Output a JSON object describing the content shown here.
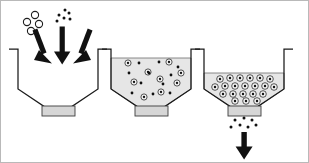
{
  "figure": {
    "title": "Three-stage particle encapsulation and discharge in a hopper vessel",
    "background_color": "#ffffff",
    "border_color": "#b9b9b9",
    "width": 309,
    "height": 163,
    "stage_count": 3
  },
  "palette": {
    "outline": "#1a1a1a",
    "bed_fill": "#e6e6e6",
    "bed_stroke": "#5a5a5a",
    "valve_fill": "#d6d6d6",
    "valve_stroke": "#3d3d3d",
    "particle_ring_fill": "#f2f2f2",
    "particle_ring_stroke": "#222222",
    "particle_core": "#111111",
    "dot_color": "#111111",
    "open_circle_stroke": "#1d1d1d",
    "arrow_color": "#111111"
  },
  "stages": [
    {
      "id": "stage-1",
      "name": "charging",
      "label": "",
      "vessel": {
        "left_wall_x": 17,
        "right_wall_x": 97,
        "rim_y": 48,
        "lip_width": 9,
        "taper_start_y": 88,
        "outlet_left_x": 44,
        "outlet_right_x": 70,
        "outlet_y": 106
      },
      "bed": {
        "present": false,
        "fill_level_y": null
      },
      "valve": {
        "present": true,
        "x": 41,
        "y": 105,
        "width": 33,
        "height": 10,
        "open": false
      },
      "feed_arrows": [
        {
          "id": "arrow-left",
          "x1": 33,
          "y1": 30,
          "x2": 45,
          "y2": 63,
          "angle_deg": 20
        },
        {
          "id": "arrow-center",
          "x1": 61,
          "y1": 26,
          "x2": 61,
          "y2": 63,
          "angle_deg": 0
        },
        {
          "id": "arrow-right",
          "x1": 90,
          "y1": 30,
          "x2": 78,
          "y2": 63,
          "angle_deg": -20
        }
      ],
      "open_circles": [
        {
          "cx": 34,
          "cy": 14,
          "r": 3.6
        },
        {
          "cx": 26,
          "cy": 21,
          "r": 3.6
        },
        {
          "cx": 38,
          "cy": 23,
          "r": 3.6
        },
        {
          "cx": 30,
          "cy": 30,
          "r": 3.6
        }
      ],
      "free_dots": [
        {
          "cx": 64,
          "cy": 9,
          "r": 1.5
        },
        {
          "cx": 68,
          "cy": 12,
          "r": 1.5
        },
        {
          "cx": 58,
          "cy": 14,
          "r": 1.5
        },
        {
          "cx": 63,
          "cy": 17,
          "r": 1.5
        },
        {
          "cx": 69,
          "cy": 18,
          "r": 1.5
        },
        {
          "cx": 56,
          "cy": 20,
          "r": 1.5
        }
      ],
      "encapsulated_particles": [],
      "discharge": {
        "present": false
      }
    },
    {
      "id": "stage-2",
      "name": "suspension",
      "label": "",
      "vessel": {
        "left_wall_x": 110,
        "right_wall_x": 190,
        "rim_y": 48,
        "lip_width": 9,
        "taper_start_y": 88,
        "outlet_left_x": 137,
        "outlet_right_x": 163,
        "outlet_y": 106
      },
      "bed": {
        "present": true,
        "fill_level_y": 57
      },
      "valve": {
        "present": true,
        "x": 134,
        "y": 105,
        "width": 33,
        "height": 10,
        "open": false
      },
      "feed_arrows": [],
      "open_circles": [],
      "free_dots": [
        {
          "cx": 138,
          "cy": 62,
          "r": 1.4
        },
        {
          "cx": 158,
          "cy": 61,
          "r": 1.4
        },
        {
          "cx": 177,
          "cy": 66,
          "r": 1.4
        },
        {
          "cx": 128,
          "cy": 72,
          "r": 1.4
        },
        {
          "cx": 148,
          "cy": 72,
          "r": 1.4
        },
        {
          "cx": 170,
          "cy": 74,
          "r": 1.4
        },
        {
          "cx": 140,
          "cy": 82,
          "r": 1.4
        },
        {
          "cx": 162,
          "cy": 83,
          "r": 1.4
        },
        {
          "cx": 131,
          "cy": 92,
          "r": 1.4
        },
        {
          "cx": 152,
          "cy": 93,
          "r": 1.4
        },
        {
          "cx": 169,
          "cy": 92,
          "r": 1.4
        }
      ],
      "encapsulated_particles": [
        {
          "cx": 127,
          "cy": 62,
          "r": 3.1
        },
        {
          "cx": 168,
          "cy": 61,
          "r": 3.1
        },
        {
          "cx": 147,
          "cy": 71,
          "r": 3.1
        },
        {
          "cx": 180,
          "cy": 72,
          "r": 3.1
        },
        {
          "cx": 159,
          "cy": 78,
          "r": 3.1
        },
        {
          "cx": 133,
          "cy": 81,
          "r": 3.1
        },
        {
          "cx": 176,
          "cy": 82,
          "r": 3.1
        },
        {
          "cx": 160,
          "cy": 91,
          "r": 3.1
        },
        {
          "cx": 143,
          "cy": 96,
          "r": 3.1
        }
      ],
      "discharge": {
        "present": false
      }
    },
    {
      "id": "stage-3",
      "name": "discharge",
      "label": "",
      "vessel": {
        "left_wall_x": 203,
        "right_wall_x": 283,
        "rim_y": 48,
        "lip_width": 9,
        "taper_start_y": 88,
        "outlet_left_x": 230,
        "outlet_right_x": 256,
        "outlet_y": 106
      },
      "bed": {
        "present": true,
        "fill_level_y": 72
      },
      "valve": {
        "present": true,
        "x": 227,
        "y": 105,
        "width": 33,
        "height": 10,
        "open": true
      },
      "feed_arrows": [],
      "open_circles": [],
      "free_dots": [],
      "encapsulated_particles": [
        {
          "cx": 219,
          "cy": 78,
          "r": 3.3
        },
        {
          "cx": 229,
          "cy": 77,
          "r": 3.3
        },
        {
          "cx": 239,
          "cy": 77,
          "r": 3.3
        },
        {
          "cx": 249,
          "cy": 77,
          "r": 3.3
        },
        {
          "cx": 259,
          "cy": 77,
          "r": 3.3
        },
        {
          "cx": 269,
          "cy": 78,
          "r": 3.3
        },
        {
          "cx": 214,
          "cy": 86,
          "r": 3.3
        },
        {
          "cx": 224,
          "cy": 85,
          "r": 3.3
        },
        {
          "cx": 234,
          "cy": 85,
          "r": 3.3
        },
        {
          "cx": 244,
          "cy": 85,
          "r": 3.3
        },
        {
          "cx": 254,
          "cy": 85,
          "r": 3.3
        },
        {
          "cx": 264,
          "cy": 85,
          "r": 3.3
        },
        {
          "cx": 273,
          "cy": 86,
          "r": 3.3
        },
        {
          "cx": 222,
          "cy": 93,
          "r": 3.3
        },
        {
          "cx": 232,
          "cy": 93,
          "r": 3.3
        },
        {
          "cx": 242,
          "cy": 93,
          "r": 3.3
        },
        {
          "cx": 252,
          "cy": 93,
          "r": 3.3
        },
        {
          "cx": 262,
          "cy": 93,
          "r": 3.3
        },
        {
          "cx": 234,
          "cy": 100,
          "r": 3.3
        },
        {
          "cx": 245,
          "cy": 100,
          "r": 3.3
        },
        {
          "cx": 256,
          "cy": 100,
          "r": 3.3
        }
      ],
      "discharge": {
        "present": true,
        "dots": [
          {
            "cx": 234,
            "cy": 119,
            "r": 1.5
          },
          {
            "cx": 243,
            "cy": 117,
            "r": 1.5
          },
          {
            "cx": 251,
            "cy": 119,
            "r": 1.5
          },
          {
            "cx": 230,
            "cy": 126,
            "r": 1.5
          },
          {
            "cx": 239,
            "cy": 124,
            "r": 1.5
          },
          {
            "cx": 247,
            "cy": 126,
            "r": 1.5
          },
          {
            "cx": 255,
            "cy": 124,
            "r": 1.5
          }
        ],
        "arrow": {
          "id": "discharge-arrow",
          "x1": 243,
          "y1": 131,
          "x2": 243,
          "y2": 158,
          "angle_deg": 0
        }
      }
    }
  ]
}
